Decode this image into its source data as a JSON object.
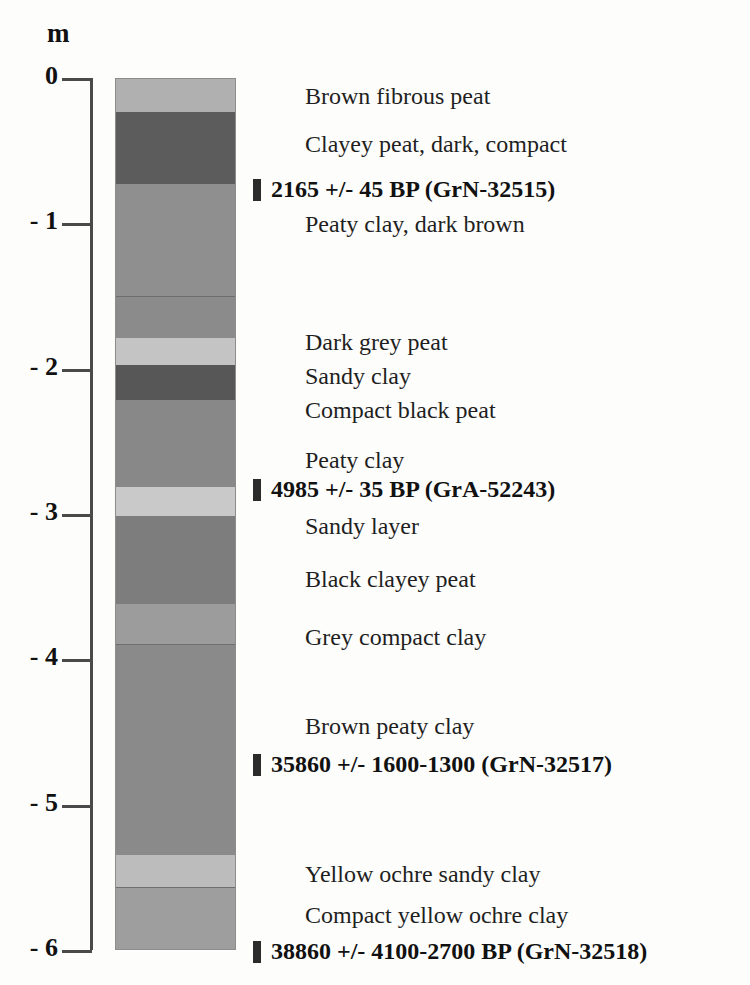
{
  "axis": {
    "unit": "m",
    "ticks": [
      {
        "label": "0",
        "depth": 0
      },
      {
        "label": "- 1",
        "depth": 1
      },
      {
        "label": "- 2",
        "depth": 2
      },
      {
        "label": "- 3",
        "depth": 3
      },
      {
        "label": "- 4",
        "depth": 4
      },
      {
        "label": "- 5",
        "depth": 5
      },
      {
        "label": "- 6",
        "depth": 6
      }
    ]
  },
  "chart_data": {
    "type": "table",
    "title": "",
    "xlabel": "",
    "ylabel": "m",
    "ylim": [
      -6,
      0
    ],
    "grid": false,
    "legend": "none",
    "units": "metres below surface",
    "column_left_px": 115,
    "column_width_px": 121,
    "layers": [
      {
        "name": "Brown fibrous peat",
        "top_m": 0.0,
        "bottom_m": 0.23,
        "color": "#b0b0b0",
        "boundary": false
      },
      {
        "name": "Clayey peat, dark, compact",
        "top_m": 0.23,
        "bottom_m": 0.72,
        "color": "#5c5c5c",
        "boundary": false
      },
      {
        "name": "Peaty clay, dark brown",
        "top_m": 0.72,
        "bottom_m": 1.49,
        "color": "#8f8f8f",
        "boundary": false
      },
      {
        "name": "Dark grey peat",
        "top_m": 1.49,
        "bottom_m": 1.78,
        "color": "#8b8b8b",
        "boundary": true
      },
      {
        "name": "Sandy clay",
        "top_m": 1.78,
        "bottom_m": 1.97,
        "color": "#c4c4c4",
        "boundary": false
      },
      {
        "name": "Compact black peat",
        "top_m": 1.97,
        "bottom_m": 2.21,
        "color": "#575757",
        "boundary": false
      },
      {
        "name": "Peaty clay",
        "top_m": 2.21,
        "bottom_m": 2.81,
        "color": "#888888",
        "boundary": false
      },
      {
        "name": "Sandy layer",
        "top_m": 2.81,
        "bottom_m": 3.01,
        "color": "#c9c9c9",
        "boundary": false
      },
      {
        "name": "Black clayey peat",
        "top_m": 3.01,
        "bottom_m": 3.61,
        "color": "#7d7d7d",
        "boundary": false
      },
      {
        "name": "Grey compact clay",
        "top_m": 3.61,
        "bottom_m": 3.89,
        "color": "#9c9c9c",
        "boundary": false
      },
      {
        "name": "Brown peaty clay",
        "top_m": 3.89,
        "bottom_m": 5.34,
        "color": "#8a8a8a",
        "boundary": true
      },
      {
        "name": "Yellow ochre sandy clay",
        "top_m": 5.34,
        "bottom_m": 5.56,
        "color": "#bcbcbc",
        "boundary": false
      },
      {
        "name": "Compact yellow ochre clay",
        "top_m": 5.56,
        "bottom_m": 6.0,
        "color": "#9e9e9e",
        "boundary": true
      }
    ],
    "descriptions": [
      {
        "text": "Brown fibrous peat",
        "y_px": 84,
        "x_px": 305
      },
      {
        "text": "Clayey peat, dark, compact",
        "y_px": 132,
        "x_px": 305
      },
      {
        "text": "Peaty clay, dark brown",
        "y_px": 212,
        "x_px": 305
      },
      {
        "text": "Dark grey peat",
        "y_px": 330,
        "x_px": 305
      },
      {
        "text": "Sandy clay",
        "y_px": 364,
        "x_px": 305
      },
      {
        "text": "Compact black peat",
        "y_px": 398,
        "x_px": 305
      },
      {
        "text": "Peaty clay",
        "y_px": 448,
        "x_px": 305
      },
      {
        "text": "Sandy layer",
        "y_px": 514,
        "x_px": 305
      },
      {
        "text": "Black clayey peat",
        "y_px": 567,
        "x_px": 305
      },
      {
        "text": "Grey compact clay",
        "y_px": 625,
        "x_px": 305
      },
      {
        "text": "Brown peaty clay",
        "y_px": 714,
        "x_px": 305
      },
      {
        "text": "Yellow ochre sandy clay",
        "y_px": 862,
        "x_px": 305
      },
      {
        "text": "Compact yellow ochre clay",
        "y_px": 903,
        "x_px": 305
      }
    ],
    "radiocarbon_dates": [
      {
        "text": "2165 +/- 45 BP (GrN-32515)",
        "y_px": 176,
        "x_px": 253,
        "age_bp": 2165,
        "error": "45",
        "lab_code": "GrN-32515"
      },
      {
        "text": "4985 +/- 35 BP (GrA-52243)",
        "y_px": 476,
        "x_px": 253,
        "age_bp": 4985,
        "error": "35",
        "lab_code": "GrA-52243"
      },
      {
        "text": "35860 +/- 1600-1300 (GrN-32517)",
        "y_px": 751,
        "x_px": 253,
        "age_bp": 35860,
        "error": "1600-1300",
        "lab_code": "GrN-32517"
      },
      {
        "text": "38860 +/- 4100-2700 BP (GrN-32518)",
        "y_px": 938,
        "x_px": 253,
        "age_bp": 38860,
        "error": "4100-2700",
        "lab_code": "GrN-32518"
      }
    ]
  }
}
